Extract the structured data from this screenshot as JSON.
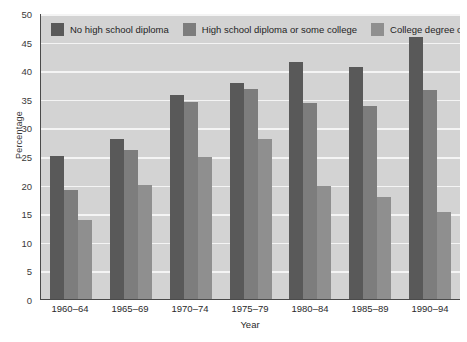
{
  "chart_data": {
    "type": "bar",
    "title": "",
    "xlabel": "Year",
    "ylabel": "Percentage",
    "categories": [
      "1960–64",
      "1965–69",
      "1970–74",
      "1975–79",
      "1980–84",
      "1985–89",
      "1990–94"
    ],
    "ylim": [
      0,
      50
    ],
    "yticks": [
      0,
      5,
      10,
      15,
      20,
      25,
      30,
      35,
      40,
      45,
      50
    ],
    "grid": true,
    "legend_position": "top",
    "series": [
      {
        "name": "No high school diploma",
        "color": "#595959",
        "values": [
          25.0,
          28.0,
          35.7,
          37.7,
          41.5,
          40.6,
          45.8
        ]
      },
      {
        "name": "High school diploma or some college",
        "color": "#7d7d7d",
        "values": [
          19.0,
          26.0,
          34.5,
          36.8,
          34.3,
          33.7,
          36.6
        ]
      },
      {
        "name": "College degree or more",
        "color": "#8f8f8f",
        "values": [
          13.8,
          20.0,
          24.8,
          28.0,
          19.8,
          17.8,
          15.2
        ]
      }
    ]
  },
  "colors": {
    "plot_background": "#d3d3d3",
    "gridline": "#f4f4f4",
    "axis": "#4a4a4a",
    "page_background": "#ffffff"
  }
}
